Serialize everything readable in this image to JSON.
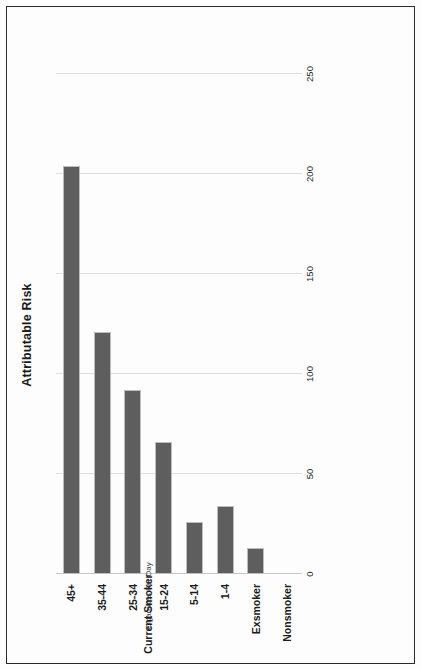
{
  "chart_data": {
    "type": "bar",
    "orientation": "horizontal",
    "title": "Attributable Risk",
    "xlabel": "",
    "ylabel": "",
    "categories": [
      "Nonsmoker",
      "Exsmoker",
      "1-4",
      "5-14",
      "15-24",
      "25-34",
      "35-44",
      "45+"
    ],
    "values": [
      0,
      13,
      34,
      26,
      66,
      92,
      121,
      204
    ],
    "xlim": [
      0,
      260
    ],
    "xticks": [
      0,
      50,
      100,
      150,
      200,
      250
    ],
    "xtick_labels": [
      "0",
      "50",
      "100",
      "150",
      "200",
      "250"
    ],
    "grid": true,
    "legend": false,
    "bar_color": "#5e5e5e",
    "bar_border_color": "#bdbdbd",
    "grid_color": "#dedede",
    "annotations": [
      {
        "text": "Cigarettes Per Day",
        "style": "regular",
        "describes": "1-4 through 45+ categories"
      },
      {
        "text": "Current Smoker",
        "style": "bold",
        "describes": "1-4 through 45+ categories"
      }
    ]
  },
  "axis_group_labels": {
    "cigarettes_per_day": "Cigarettes Per Day",
    "current_smoker": "Current Smoker"
  }
}
